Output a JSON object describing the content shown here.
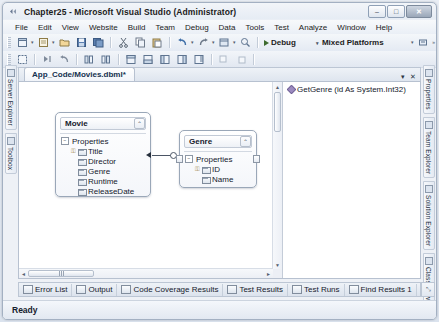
{
  "window": {
    "title": "Chapter25 - Microsoft Visual Studio (Administrator)",
    "logo_icon": "vs-logo-icon",
    "buttons": {
      "minimize": "–",
      "maximize": "□",
      "close": "✕"
    }
  },
  "menubar": {
    "items": [
      {
        "label": "File"
      },
      {
        "label": "Edit"
      },
      {
        "label": "View"
      },
      {
        "label": "Website"
      },
      {
        "label": "Build"
      },
      {
        "label": "Team"
      },
      {
        "label": "Debug"
      },
      {
        "label": "Data"
      },
      {
        "label": "Tools"
      },
      {
        "label": "Test"
      },
      {
        "label": "Analyze"
      },
      {
        "label": "Window"
      },
      {
        "label": "Help"
      }
    ]
  },
  "toolbar": {
    "debug_label": "Debug",
    "platform_label": "Mixed Platforms",
    "dropdown_arrow": "▾",
    "overflow_arrow": "»"
  },
  "left_tabs": [
    {
      "label": "Server Explorer"
    },
    {
      "label": "Toolbox"
    }
  ],
  "right_tabs": [
    {
      "label": "Properties"
    },
    {
      "label": "Team Explorer"
    },
    {
      "label": "Solution Explorer"
    },
    {
      "label": "Class View"
    }
  ],
  "document_tab": {
    "label": "App_Code/Movies.dbml*",
    "dropdown_glyph": "▾",
    "close_glyph": "✕"
  },
  "designer": {
    "entities": [
      {
        "name": "Movie",
        "section": "Properties",
        "collapse_glyph": "⌃",
        "expander_glyph": "−",
        "properties": [
          {
            "name": "Title",
            "is_key": true
          },
          {
            "name": "Director",
            "is_key": false
          },
          {
            "name": "Genre",
            "is_key": false
          },
          {
            "name": "Runtime",
            "is_key": false
          },
          {
            "name": "ReleaseDate",
            "is_key": false
          }
        ]
      },
      {
        "name": "Genre",
        "section": "Properties",
        "collapse_glyph": "⌃",
        "expander_glyph": "−",
        "properties": [
          {
            "name": "ID",
            "is_key": true
          },
          {
            "name": "Name",
            "is_key": false
          }
        ]
      }
    ]
  },
  "methods_pane": {
    "items": [
      {
        "label": "GetGenre (id As System.Int32)"
      }
    ]
  },
  "scrollbars": {
    "up_arrow": "▲",
    "down_arrow": "▼",
    "left_arrow": "◄",
    "right_arrow": "►"
  },
  "bottom_tabs": [
    {
      "label": "Error List"
    },
    {
      "label": "Output"
    },
    {
      "label": "Code Coverage Results"
    },
    {
      "label": "Test Results"
    },
    {
      "label": "Test Runs"
    },
    {
      "label": "Find Results 1"
    },
    {
      "label": "Find Symbol Resu"
    }
  ],
  "bottom_tab_overflow": "⤡",
  "statusbar": {
    "text": "Ready"
  },
  "colors": {
    "chrome": "#e6ecf4",
    "accent": "#15314f",
    "entity_border": "#9aa7b8",
    "key": "#8a6d1f"
  }
}
